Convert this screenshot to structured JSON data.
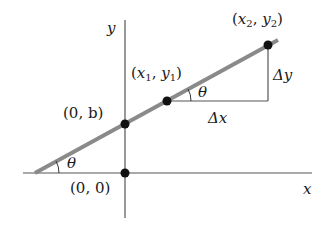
{
  "diagram": {
    "type": "slope-of-line",
    "axes": {
      "x_label": "x",
      "y_label": "y"
    },
    "points": [
      {
        "id": "origin",
        "label": "(0, 0)"
      },
      {
        "id": "y_intercept",
        "label": "(0, b)"
      },
      {
        "id": "p1",
        "label_pre": "(",
        "var1": "x",
        "sub1": "1",
        "comma": ", ",
        "var2": "y",
        "sub2": "1",
        "label_post": ")"
      },
      {
        "id": "p2",
        "label_pre": "(",
        "var1": "x",
        "sub1": "2",
        "comma": ", ",
        "var2": "y",
        "sub2": "2",
        "label_post": ")"
      }
    ],
    "labels": {
      "delta_x": "Δx",
      "delta_y": "Δy",
      "theta_intercept": "θ",
      "theta_triangle": "θ",
      "origin": "(0, 0)",
      "y_intercept": "(0, b)"
    },
    "colors": {
      "line": "#8a8a8a",
      "axes": "#555555",
      "points": "#111111",
      "text": "#1a1a1a"
    }
  }
}
